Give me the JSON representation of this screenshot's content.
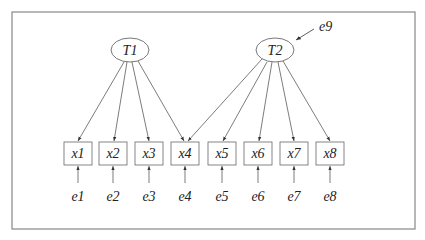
{
  "diagram": {
    "type": "structural-equation-model",
    "latent": [
      {
        "id": "T1",
        "label": "T1",
        "cx": 130,
        "cy": 50
      },
      {
        "id": "T2",
        "label": "T2",
        "cx": 275,
        "cy": 50
      }
    ],
    "observed": [
      {
        "id": "x1",
        "label": "x1",
        "x": 64,
        "error": "e1"
      },
      {
        "id": "x2",
        "label": "x2",
        "x": 99,
        "error": "e2"
      },
      {
        "id": "x3",
        "label": "x3",
        "x": 135,
        "error": "e3"
      },
      {
        "id": "x4",
        "label": "x4",
        "x": 171,
        "error": "e4"
      },
      {
        "id": "x5",
        "label": "x5",
        "x": 208,
        "error": "e5"
      },
      {
        "id": "x6",
        "label": "x6",
        "x": 244,
        "error": "e6"
      },
      {
        "id": "x7",
        "label": "x7",
        "x": 280,
        "error": "e7"
      },
      {
        "id": "x8",
        "label": "x8",
        "x": 316,
        "error": "e8"
      }
    ],
    "paths": [
      {
        "from": "T1",
        "to": "x1"
      },
      {
        "from": "T1",
        "to": "x2"
      },
      {
        "from": "T1",
        "to": "x3"
      },
      {
        "from": "T1",
        "to": "x4"
      },
      {
        "from": "T2",
        "to": "x4"
      },
      {
        "from": "T2",
        "to": "x5"
      },
      {
        "from": "T2",
        "to": "x6"
      },
      {
        "from": "T2",
        "to": "x7"
      },
      {
        "from": "T2",
        "to": "x8"
      }
    ],
    "disturbance": {
      "label": "e9",
      "target": "T2"
    },
    "labels": {
      "T1": "T1",
      "T2": "T2",
      "e9": "e9",
      "x1": "x1",
      "x2": "x2",
      "x3": "x3",
      "x4": "x4",
      "x5": "x5",
      "x6": "x6",
      "x7": "x7",
      "x8": "x8",
      "e1": "e1",
      "e2": "e2",
      "e3": "e3",
      "e4": "e4",
      "e5": "e5",
      "e6": "e6",
      "e7": "e7",
      "e8": "e8"
    }
  }
}
